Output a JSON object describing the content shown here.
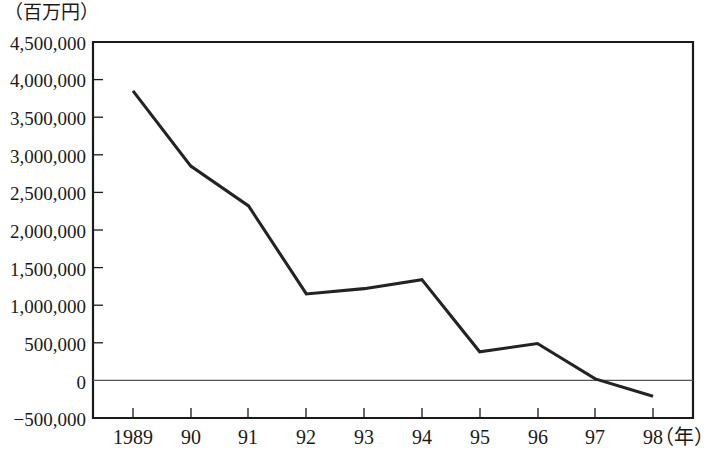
{
  "chart_data": {
    "type": "line",
    "title": "",
    "subtitle": "",
    "xlabel": "年",
    "ylabel": "",
    "unit_caption": "（百万円）",
    "grid": false,
    "legend": null,
    "x": [
      "1989",
      "90",
      "91",
      "92",
      "93",
      "94",
      "95",
      "96",
      "97",
      "98"
    ],
    "categories": [
      "1989",
      "90",
      "91",
      "92",
      "93",
      "94",
      "95",
      "96",
      "97",
      "98"
    ],
    "values": [
      3850000,
      2850000,
      2320000,
      1150000,
      1220000,
      1340000,
      380000,
      490000,
      20000,
      -210000
    ],
    "series": [
      {
        "name": "金額",
        "values": [
          3850000,
          2850000,
          2320000,
          1150000,
          1220000,
          1340000,
          380000,
          490000,
          20000,
          -210000
        ]
      }
    ],
    "ylim": [
      -500000,
      4500000
    ],
    "ytick_values": [
      4500000,
      4000000,
      3500000,
      3000000,
      2500000,
      2000000,
      1500000,
      1000000,
      500000,
      0,
      -500000
    ],
    "ytick_labels": [
      "4,500,000",
      "4,000,000",
      "3,500,000",
      "3,000,000",
      "2,500,000",
      "2,000,000",
      "1,500,000",
      "1,000,000",
      "500,000",
      "0",
      "−500,000"
    ],
    "xtick_labels": [
      "1989",
      "90",
      "91",
      "92",
      "93",
      "94",
      "95",
      "96",
      "97",
      "98"
    ],
    "x_axis_unit_suffix": "（年）",
    "zero_reference_line": 0,
    "line_color": "#232323",
    "axis_color": "#1a1a1a",
    "background_color": "#ffffff"
  }
}
